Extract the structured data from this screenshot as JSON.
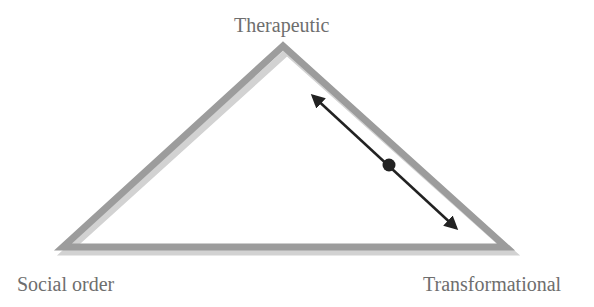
{
  "diagram": {
    "type": "triangle",
    "vertices": {
      "top": "Therapeutic",
      "bottom_left": "Social order",
      "bottom_right": "Transformational"
    },
    "arrow": {
      "description": "double-headed arrow parallel to the right side (Therapeutic–Transformational) with a dot marker",
      "color": "#222222"
    },
    "colors": {
      "triangle_stroke": "#9a9a9a",
      "triangle_shadow": "#cfcfcf",
      "label_text": "#6e6e6e"
    }
  }
}
